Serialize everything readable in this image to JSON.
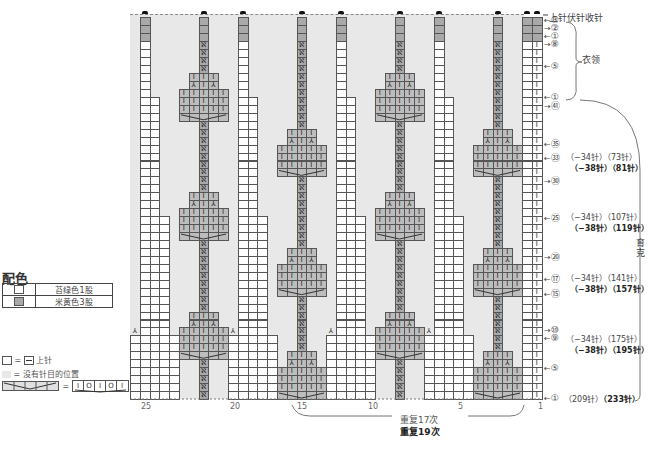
{
  "legend": {
    "title": "配色",
    "colors": [
      {
        "swatch": "white",
        "label": "苔绿色1股"
      },
      {
        "swatch": "grey",
        "label": "米黄色3股"
      }
    ],
    "symbols": [
      {
        "eq": "=",
        "label": "上针",
        "prefix": "□ ="
      },
      {
        "label": "= 没有针目的位置"
      },
      {
        "label": "="
      }
    ]
  },
  "chart_labels": {
    "top_right": "上针伏针收针",
    "collar": "衣领",
    "yoke": "育克",
    "repeat_a": "重复17次",
    "repeat_b": "重复19次"
  },
  "column_numbers": [
    {
      "label": "25",
      "x": 141
    },
    {
      "label": "20",
      "x": 230
    },
    {
      "label": "15",
      "x": 297
    },
    {
      "label": "10",
      "x": 368
    },
    {
      "label": "5",
      "x": 458
    },
    {
      "label": "1",
      "x": 538
    }
  ],
  "row_markers": [
    {
      "num": "③",
      "dir": "left",
      "y": 20
    },
    {
      "num": "②",
      "dir": "right",
      "y": 28
    },
    {
      "num": "①",
      "dir": "left",
      "y": 36
    },
    {
      "num": "⑧",
      "dir": "right",
      "y": 44
    },
    {
      "num": "⑤",
      "dir": "left",
      "y": 66
    },
    {
      "num": "①",
      "dir": "left",
      "y": 97
    },
    {
      "num": "㊶",
      "dir": "right",
      "y": 104
    },
    {
      "num": "㉟",
      "dir": "left",
      "y": 142
    },
    {
      "num": "㉝",
      "dir": "left",
      "y": 156
    },
    {
      "num": "㉚",
      "dir": "right",
      "y": 179
    },
    {
      "num": "㉕",
      "dir": "left",
      "y": 216
    },
    {
      "num": "⑳",
      "dir": "right",
      "y": 255
    },
    {
      "num": "⑰",
      "dir": "left",
      "y": 277
    },
    {
      "num": "⑮",
      "dir": "left",
      "y": 292
    },
    {
      "num": "⑩",
      "dir": "right",
      "y": 330
    },
    {
      "num": "⑨",
      "dir": "left",
      "y": 338
    },
    {
      "num": "⑤",
      "dir": "left",
      "y": 368
    },
    {
      "num": "①",
      "dir": "left",
      "y": 398
    }
  ],
  "stitch_counts": [
    {
      "y": 156,
      "a": "（−34针）（73针）",
      "b": "（−38针）（81针）"
    },
    {
      "y": 216,
      "a": "（−34针）（107针）",
      "b": "（−38针）（119针）"
    },
    {
      "y": 277,
      "a": "（−34针）（141针）",
      "b": "（−38针）（157针）"
    },
    {
      "y": 338,
      "a": "（−34针）（175针）",
      "b": "（−38针）（195针）"
    },
    {
      "y": 398,
      "a": "（209针）",
      "b": "（233针）",
      "inline": true
    }
  ],
  "chart_data": {
    "type": "knitting-chart",
    "columns": 41,
    "rows": 48,
    "repeat_widths_px": 97,
    "repeats_x": [
      130,
      228,
      326,
      424
    ],
    "colors": {
      "main": "#ffffff",
      "contrast": "#a9a9a9",
      "no_stitch": "#e8e8e8"
    }
  }
}
